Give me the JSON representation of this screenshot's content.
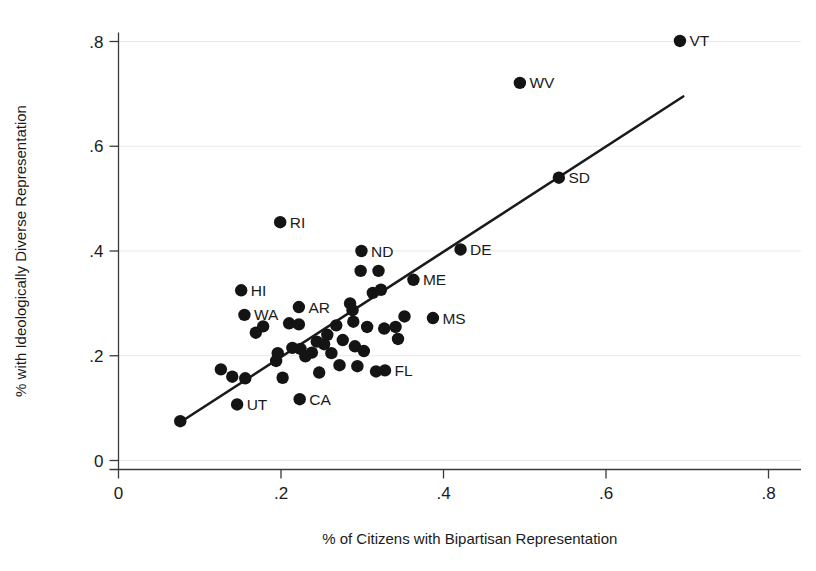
{
  "chart_data": {
    "type": "scatter",
    "title": "",
    "xlabel": "% of Citizens with Bipartisan Representation",
    "ylabel": "% with Ideologically Diverse Representation",
    "xlim": [
      0,
      0.8
    ],
    "ylim": [
      0,
      0.8
    ],
    "xticks": [
      0,
      0.2,
      0.4,
      0.6,
      0.8
    ],
    "xtick_labels": [
      "0",
      ".2",
      ".4",
      ".6",
      ".8"
    ],
    "yticks": [
      0,
      0.2,
      0.4,
      0.6,
      0.8
    ],
    "ytick_labels": [
      "0",
      ".2",
      ".4",
      ".6",
      ".8"
    ],
    "grid": "horizontal",
    "legend": "none",
    "marker_color": "#141414",
    "line_color": "#1a1a1a",
    "grid_color": "#e9e9e9",
    "fit_line": {
      "label": "linear fit",
      "x0": 0.076,
      "y0": 0.073,
      "x1": 0.695,
      "y1": 0.695
    },
    "points": [
      {
        "label": "VT",
        "x": 0.691,
        "y": 0.801,
        "label_pos": "right"
      },
      {
        "label": "WV",
        "x": 0.494,
        "y": 0.721,
        "label_pos": "right"
      },
      {
        "label": "SD",
        "x": 0.542,
        "y": 0.54,
        "label_pos": "right"
      },
      {
        "label": "RI",
        "x": 0.199,
        "y": 0.455,
        "label_pos": "right"
      },
      {
        "label": "DE",
        "x": 0.421,
        "y": 0.403,
        "label_pos": "right"
      },
      {
        "label": "ND",
        "x": 0.299,
        "y": 0.4,
        "label_pos": "right"
      },
      {
        "label": "ME",
        "x": 0.363,
        "y": 0.345,
        "label_pos": "right"
      },
      {
        "label": "MS",
        "x": 0.387,
        "y": 0.272,
        "label_pos": "right"
      },
      {
        "label": "HI",
        "x": 0.151,
        "y": 0.325,
        "label_pos": "right"
      },
      {
        "label": "AR",
        "x": 0.222,
        "y": 0.293,
        "label_pos": "right"
      },
      {
        "label": "WA",
        "x": 0.155,
        "y": 0.278,
        "label_pos": "right"
      },
      {
        "label": "FL",
        "x": 0.328,
        "y": 0.172,
        "label_pos": "right"
      },
      {
        "label": "CA",
        "x": 0.223,
        "y": 0.117,
        "label_pos": "right"
      },
      {
        "label": "UT",
        "x": 0.146,
        "y": 0.107,
        "label_pos": "right"
      },
      {
        "label": "",
        "x": 0.076,
        "y": 0.075,
        "label_pos": ""
      },
      {
        "label": "",
        "x": 0.126,
        "y": 0.174,
        "label_pos": ""
      },
      {
        "label": "",
        "x": 0.14,
        "y": 0.16,
        "label_pos": ""
      },
      {
        "label": "",
        "x": 0.156,
        "y": 0.157,
        "label_pos": ""
      },
      {
        "label": "",
        "x": 0.169,
        "y": 0.244,
        "label_pos": ""
      },
      {
        "label": "",
        "x": 0.178,
        "y": 0.256,
        "label_pos": ""
      },
      {
        "label": "",
        "x": 0.194,
        "y": 0.19,
        "label_pos": ""
      },
      {
        "label": "",
        "x": 0.196,
        "y": 0.205,
        "label_pos": ""
      },
      {
        "label": "",
        "x": 0.202,
        "y": 0.158,
        "label_pos": ""
      },
      {
        "label": "",
        "x": 0.21,
        "y": 0.262,
        "label_pos": ""
      },
      {
        "label": "",
        "x": 0.214,
        "y": 0.215,
        "label_pos": ""
      },
      {
        "label": "",
        "x": 0.222,
        "y": 0.26,
        "label_pos": ""
      },
      {
        "label": "",
        "x": 0.224,
        "y": 0.213,
        "label_pos": ""
      },
      {
        "label": "",
        "x": 0.23,
        "y": 0.199,
        "label_pos": ""
      },
      {
        "label": "",
        "x": 0.238,
        "y": 0.206,
        "label_pos": ""
      },
      {
        "label": "",
        "x": 0.244,
        "y": 0.227,
        "label_pos": ""
      },
      {
        "label": "",
        "x": 0.247,
        "y": 0.168,
        "label_pos": ""
      },
      {
        "label": "",
        "x": 0.253,
        "y": 0.222,
        "label_pos": ""
      },
      {
        "label": "",
        "x": 0.257,
        "y": 0.24,
        "label_pos": ""
      },
      {
        "label": "",
        "x": 0.262,
        "y": 0.205,
        "label_pos": ""
      },
      {
        "label": "",
        "x": 0.268,
        "y": 0.258,
        "label_pos": ""
      },
      {
        "label": "",
        "x": 0.272,
        "y": 0.182,
        "label_pos": ""
      },
      {
        "label": "",
        "x": 0.276,
        "y": 0.23,
        "label_pos": ""
      },
      {
        "label": "",
        "x": 0.285,
        "y": 0.3,
        "label_pos": ""
      },
      {
        "label": "",
        "x": 0.288,
        "y": 0.287,
        "label_pos": ""
      },
      {
        "label": "",
        "x": 0.289,
        "y": 0.265,
        "label_pos": ""
      },
      {
        "label": "",
        "x": 0.291,
        "y": 0.218,
        "label_pos": ""
      },
      {
        "label": "",
        "x": 0.294,
        "y": 0.18,
        "label_pos": ""
      },
      {
        "label": "",
        "x": 0.298,
        "y": 0.362,
        "label_pos": ""
      },
      {
        "label": "",
        "x": 0.302,
        "y": 0.209,
        "label_pos": ""
      },
      {
        "label": "",
        "x": 0.306,
        "y": 0.255,
        "label_pos": ""
      },
      {
        "label": "",
        "x": 0.313,
        "y": 0.32,
        "label_pos": ""
      },
      {
        "label": "",
        "x": 0.317,
        "y": 0.17,
        "label_pos": ""
      },
      {
        "label": "",
        "x": 0.32,
        "y": 0.362,
        "label_pos": ""
      },
      {
        "label": "",
        "x": 0.323,
        "y": 0.326,
        "label_pos": ""
      },
      {
        "label": "",
        "x": 0.327,
        "y": 0.252,
        "label_pos": ""
      },
      {
        "label": "",
        "x": 0.341,
        "y": 0.255,
        "label_pos": ""
      },
      {
        "label": "",
        "x": 0.344,
        "y": 0.232,
        "label_pos": ""
      },
      {
        "label": "",
        "x": 0.352,
        "y": 0.275,
        "label_pos": ""
      }
    ]
  },
  "axis": {
    "x_title": "% of Citizens with Bipartisan Representation",
    "y_title": "% with Ideologically Diverse Representation"
  }
}
